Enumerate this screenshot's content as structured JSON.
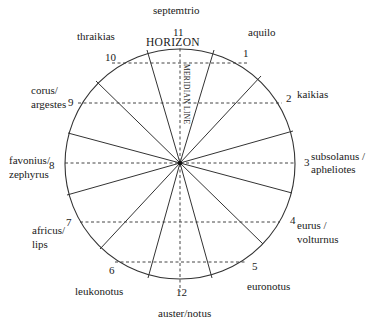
{
  "diagram": {
    "type": "wind-rose",
    "axis_labels": {
      "horizon": "HORIZON",
      "meridian": "MERIDIAN LINE"
    },
    "winds": [
      {
        "number": "1",
        "name": "aquilo"
      },
      {
        "number": "2",
        "name": "kaikias"
      },
      {
        "number": "3",
        "name": "subsolanus /",
        "name2": "apheliotes"
      },
      {
        "number": "4",
        "name": "eurus /",
        "name2": "volturnus"
      },
      {
        "number": "5",
        "name": "euronotus"
      },
      {
        "number": "6",
        "name": "leukonotus"
      },
      {
        "number": "7",
        "name": "africus/",
        "name2": "lips"
      },
      {
        "number": "8",
        "name": "favonius/",
        "name2": "zephyrus"
      },
      {
        "number": "9",
        "name": "corus/",
        "name2": "argestes"
      },
      {
        "number": "10",
        "name": "thraikias"
      },
      {
        "number": "11",
        "name": "septemtrio"
      },
      {
        "number": "12",
        "name": "auster/notus"
      }
    ],
    "colors": {
      "line": "#333333",
      "text": "#1a1a1a",
      "background": "#ffffff"
    }
  }
}
